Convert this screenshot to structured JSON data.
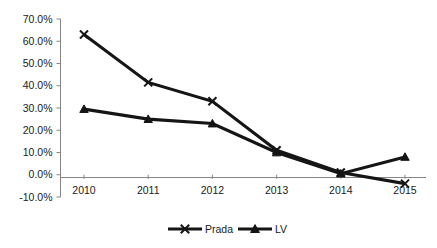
{
  "chart_data": {
    "type": "line",
    "title": "",
    "xlabel": "",
    "ylabel": "",
    "categories": [
      "2010",
      "2011",
      "2012",
      "2013",
      "2014",
      "2015"
    ],
    "series": [
      {
        "name": "Prada",
        "marker": "x-marker",
        "color": "#151515",
        "values": [
          63.0,
          41.5,
          33.0,
          11.0,
          1.0,
          -4.0
        ]
      },
      {
        "name": "LV",
        "marker": "triangle-marker",
        "color": "#151515",
        "values": [
          29.5,
          25.0,
          23.0,
          10.0,
          0.5,
          8.0
        ]
      }
    ],
    "ylim": [
      -10,
      70
    ],
    "ystep": 10,
    "ytick_labels": [
      "70.0%",
      "60.0%",
      "50.0%",
      "40.0%",
      "30.0%",
      "20.0%",
      "10.0%",
      "0.0%",
      "-10.0%"
    ],
    "ytick_values": [
      70,
      60,
      50,
      40,
      30,
      20,
      10,
      0,
      -10
    ],
    "grid": false,
    "legend_position": "bottom",
    "legend": [
      "Prada",
      "LV"
    ],
    "axis_color": "#868686",
    "line_color": "#151515",
    "background": "#ffffff"
  }
}
